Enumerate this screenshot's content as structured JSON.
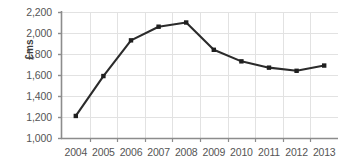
{
  "chart_data": {
    "type": "line",
    "title": "",
    "xlabel": "",
    "ylabel": "£ms",
    "categories": [
      "2004",
      "2005",
      "2006",
      "2007",
      "2008",
      "2009",
      "2010",
      "2011",
      "2012",
      "2013"
    ],
    "values": [
      1210,
      1590,
      1930,
      2060,
      2100,
      1840,
      1730,
      1670,
      1640,
      1690
    ],
    "series": [
      {
        "name": "£ms",
        "values": [
          1210,
          1590,
          1930,
          2060,
          2100,
          1840,
          1730,
          1670,
          1640,
          1690
        ]
      }
    ],
    "ylim": [
      1000,
      2200
    ],
    "ytick_labels": [
      "2,200",
      "2,000",
      "1,800",
      "1,600",
      "1,400",
      "1,200",
      "1,000"
    ],
    "ytick_values": [
      2200,
      2000,
      1800,
      1600,
      1400,
      1200,
      1000
    ],
    "xtick_labels": [
      "2004",
      "2005",
      "2006",
      "2007",
      "2008",
      "2009",
      "2010",
      "2011",
      "2012",
      "2013"
    ],
    "grid": true,
    "legend": "none",
    "colors": {
      "line": "#2b2b2b",
      "marker": "#1f1f1f",
      "grid": "#e2e2e2",
      "axis": "#8c8c8c",
      "tick_text": "#555555",
      "axis_label": "#3a3a3a",
      "background": "#ffffff"
    },
    "marker": "square"
  }
}
